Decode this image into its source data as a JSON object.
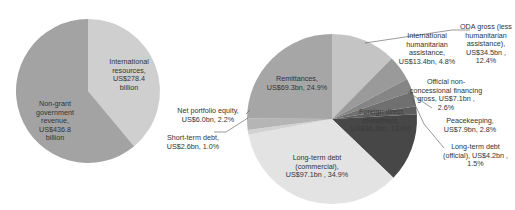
{
  "chart_data": [
    {
      "type": "pie",
      "title": "",
      "slices": [
        {
          "label": "International resources",
          "value": 278.4,
          "unit": "US$ billion",
          "text": "International\nresources,\nUS$278.4\nbillion",
          "color": "#cfcfcf"
        },
        {
          "label": "Non-grant government revenue",
          "value": 436.8,
          "unit": "US$ billion",
          "text": "Non-grant\ngovernment\nrevenue,\nUS$436.8\nbillion",
          "color": "#a3a3a3"
        }
      ],
      "start_angle_deg": 0,
      "direction": "clockwise"
    },
    {
      "type": "pie",
      "title": "",
      "slices": [
        {
          "label": "ODA gross (less humanitarian assistance)",
          "value": 34.5,
          "percent": 12.4,
          "text": "ODA gross (less\nhumanitarian\nassistance),\nUS$34.5bn ,\n12.4%",
          "color": "#c4c4c4"
        },
        {
          "label": "International humanitarian assistance",
          "value": 13.4,
          "percent": 4.8,
          "text": "International\nhumanitarian\nassistance,\nUS$13.4bn, 4.8%",
          "color": "#9a9a9a"
        },
        {
          "label": "Official non-concessional financing gross",
          "value": 7.1,
          "percent": 2.6,
          "text": "Official non-\nconcessional financing\ngross,  US$7.1bn ,\n2.6%",
          "color": "#858585"
        },
        {
          "label": "Peacekeeping",
          "value": 7.9,
          "percent": 2.8,
          "text": "Peacekeeping,\nUS$7.9bn, 2.8%",
          "color": "#707070"
        },
        {
          "label": "Long-term debt (official)",
          "value": 4.2,
          "percent": 1.5,
          "text": "Long-term debt\n(official),  US$4.2bn ,\n1.5%",
          "color": "#5e5e5e"
        },
        {
          "label": "Foreign direct investment",
          "value": 36.3,
          "percent": 13.0,
          "text": "Foreign direct\ninvestment,\nUS$36.3bn, 13.0%",
          "color": "#474747"
        },
        {
          "label": "Long-term debt (commercial)",
          "value": 97.1,
          "percent": 34.9,
          "text": "Long-term debt\n(commercial),\nUS$97.1bn , 34.9%",
          "color": "#e3e3e3"
        },
        {
          "label": "Short-term debt",
          "value": 2.6,
          "percent": 1.0,
          "text": "Short-term debt,\nUS$2.6bn, 1.0%",
          "color": "#d2d2d2"
        },
        {
          "label": "Net portfolio equity",
          "value": 6.0,
          "percent": 2.2,
          "text": "Net portfolio equity,\nUS$6.0bn, 2.2%",
          "color": "#b5b5b5"
        },
        {
          "label": "Remittances",
          "value": 69.3,
          "percent": 24.9,
          "text": "Remittances,\nUS$69.3bn, 24.9%",
          "color": "#a6a6a6"
        }
      ],
      "start_angle_deg": 0,
      "direction": "clockwise",
      "unit": "US$ billion"
    }
  ],
  "labels": {
    "left_international": "International\nresources,\nUS$278.4\nbillion",
    "left_nongrant": "Non-grant\ngovernment\nrevenue,\nUS$436.8\nbillion",
    "oda": "ODA gross (less\nhumanitarian\nassistance),\nUS$34.5bn ,\n12.4%",
    "ihum": "International\nhumanitarian\nassistance,\nUS$13.4bn, 4.8%",
    "onc": "Official non-\nconcessional financing\ngross,  US$7.1bn ,\n2.6%",
    "peace": "Peacekeeping,\nUS$7.9bn, 2.8%",
    "ltoff": "Long-term debt\n(official),  US$4.2bn ,\n1.5%",
    "fdi": "Foreign direct\ninvestment,\nUS$36.3bn, 13.0%",
    "ltcom": "Long-term debt\n(commercial),\nUS$97.1bn , 34.9%",
    "std": "Short-term debt,\nUS$2.6bn, 1.0%",
    "npe": "Net portfolio equity,\nUS$6.0bn, 2.2%",
    "remit": "Remittances,\nUS$69.3bn, 24.9%"
  }
}
